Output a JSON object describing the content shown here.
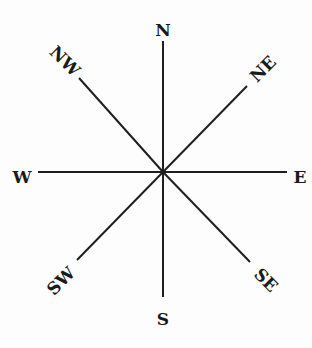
{
  "diagram": {
    "type": "compass-rose",
    "center": [
      163,
      172
    ],
    "directions": [
      {
        "label": "N",
        "line_end": [
          163,
          41
        ],
        "label_pos": [
          163,
          31
        ],
        "rotate": 0
      },
      {
        "label": "NE",
        "line_end": [
          247,
          86
        ],
        "label_pos": [
          264,
          70
        ],
        "rotate": -45
      },
      {
        "label": "E",
        "line_end": [
          287,
          172
        ],
        "label_pos": [
          300,
          178
        ],
        "rotate": 0
      },
      {
        "label": "SE",
        "line_end": [
          250,
          262
        ],
        "label_pos": [
          265,
          281
        ],
        "rotate": 45
      },
      {
        "label": "S",
        "line_end": [
          163,
          297
        ],
        "label_pos": [
          163,
          320
        ],
        "rotate": 0
      },
      {
        "label": "SW",
        "line_end": [
          77,
          260
        ],
        "label_pos": [
          62,
          282
        ],
        "rotate": -45
      },
      {
        "label": "W",
        "line_end": [
          38,
          172
        ],
        "label_pos": [
          22,
          178
        ],
        "rotate": 0
      },
      {
        "label": "NW",
        "line_end": [
          79,
          78
        ],
        "label_pos": [
          64,
          62
        ],
        "rotate": 45
      }
    ],
    "line_color": "#1e1e1e",
    "text_color": "#1a1a1a"
  }
}
